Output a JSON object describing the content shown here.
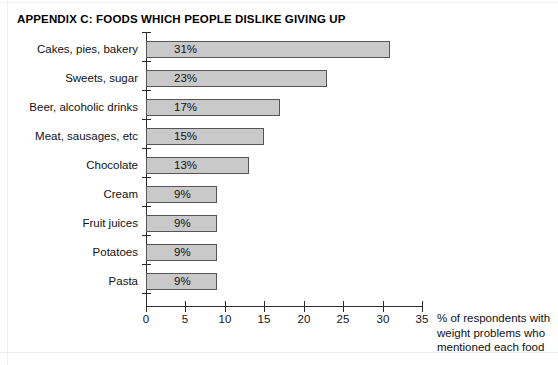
{
  "title": "APPENDIX C: FOODS WHICH PEOPLE DISLIKE GIVING UP",
  "caption": {
    "line1": "% of respondents with",
    "line2": "weight problems who",
    "line3": "mentioned each food"
  },
  "colors": {
    "bar_fill": "#c9c9c9",
    "bar_border": "#555555",
    "axis": "#2b2b2b",
    "text": "#111111",
    "background": "#ffffff"
  },
  "chart_data": {
    "type": "bar",
    "orientation": "horizontal",
    "title": "APPENDIX C: FOODS WHICH PEOPLE DISLIKE GIVING UP",
    "xlabel": "% of respondents with weight problems who mentioned each food",
    "ylabel": "",
    "xlim": [
      0,
      35
    ],
    "xticks": [
      0,
      5,
      10,
      15,
      20,
      25,
      30,
      35
    ],
    "xtick_labels": [
      "0",
      "5",
      "10",
      "15",
      "20",
      "25",
      "30",
      "35"
    ],
    "grid": false,
    "legend": false,
    "categories": [
      "Cakes, pies, bakery",
      "Sweets, sugar",
      "Beer, alcoholic drinks",
      "Meat, sausages, etc",
      "Chocolate",
      "Cream",
      "Fruit juices",
      "Potatoes",
      "Pasta"
    ],
    "values": [
      31,
      23,
      17,
      15,
      13,
      9,
      9,
      9,
      9
    ],
    "data_labels": [
      "31%",
      "23%",
      "17%",
      "15%",
      "13%",
      "9%",
      "9%",
      "9%",
      "9%"
    ]
  }
}
